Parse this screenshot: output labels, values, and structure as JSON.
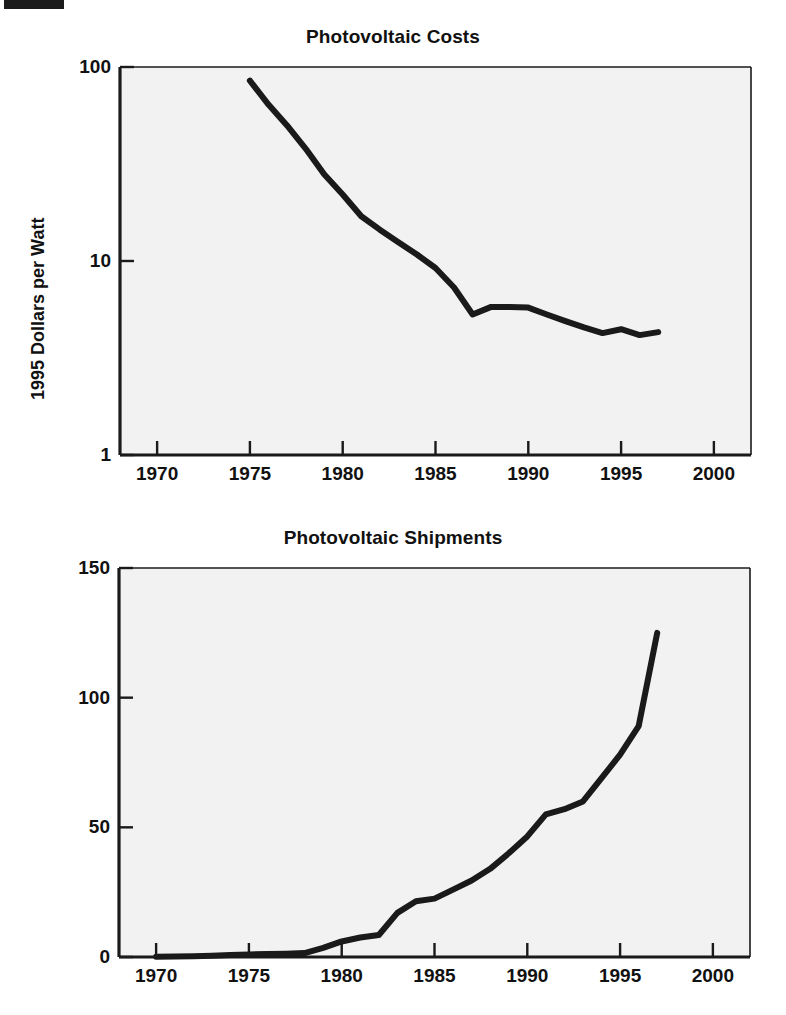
{
  "page": {
    "background_color": "#ffffff",
    "plot_fill_color": "#f2f2f2",
    "line_color": "#1a1a1a",
    "axis_color": "#1a1a1a",
    "text_color": "#111111"
  },
  "chart_data": [
    {
      "id": "photovoltaic-costs",
      "type": "line",
      "title": "Photovoltaic Costs",
      "xlabel": "",
      "ylabel": "1995 Dollars per Watt",
      "xlim": [
        1968,
        2002
      ],
      "ylim": [
        1,
        100
      ],
      "yscale": "log",
      "grid": false,
      "legend": "none",
      "xticks": [
        1970,
        1975,
        1980,
        1985,
        1990,
        1995,
        2000
      ],
      "xticklabels": [
        "1970",
        "1975",
        "1980",
        "1985",
        "1990",
        "1995",
        "2000"
      ],
      "yticks": [
        1,
        10,
        100
      ],
      "yticklabels": [
        "1",
        "10",
        "100"
      ],
      "series": [
        {
          "name": "Cost per watt",
          "x": [
            1975,
            1976,
            1977,
            1978,
            1979,
            1980,
            1981,
            1982,
            1983,
            1984,
            1985,
            1986,
            1987,
            1988,
            1989,
            1990,
            1991,
            1992,
            1993,
            1994,
            1995,
            1996,
            1997
          ],
          "values": [
            85,
            64,
            50,
            38,
            28,
            22,
            17,
            14.5,
            12.5,
            10.8,
            9.2,
            7.3,
            5.3,
            5.8,
            5.8,
            5.75,
            5.3,
            4.9,
            4.55,
            4.25,
            4.45,
            4.15,
            4.3
          ]
        }
      ]
    },
    {
      "id": "photovoltaic-shipments",
      "type": "line",
      "title": "Photovoltaic Shipments",
      "xlabel": "",
      "ylabel": "Annual Megawatts",
      "xlim": [
        1968,
        2002
      ],
      "ylim": [
        0,
        150
      ],
      "yscale": "linear",
      "grid": false,
      "legend": "none",
      "xticks": [
        1970,
        1975,
        1980,
        1985,
        1990,
        1995,
        2000
      ],
      "xticklabels": [
        "1970",
        "1975",
        "1980",
        "1985",
        "1990",
        "1995",
        "2000"
      ],
      "yticks": [
        0,
        50,
        100,
        150
      ],
      "yticklabels": [
        "0",
        "50",
        "100",
        "150"
      ],
      "series": [
        {
          "name": "Annual shipments",
          "x": [
            1970,
            1971,
            1972,
            1973,
            1974,
            1975,
            1976,
            1977,
            1978,
            1979,
            1980,
            1981,
            1982,
            1983,
            1984,
            1985,
            1986,
            1987,
            1988,
            1989,
            1990,
            1991,
            1992,
            1993,
            1994,
            1995,
            1996,
            1997
          ],
          "values": [
            0.1,
            0.2,
            0.3,
            0.5,
            0.8,
            1.0,
            1.2,
            1.3,
            1.5,
            3.5,
            6.0,
            7.5,
            8.5,
            17.0,
            21.5,
            22.5,
            26.0,
            29.5,
            34.0,
            40.0,
            46.5,
            55.0,
            57.0,
            60.0,
            69.0,
            78.0,
            89.0,
            125.0
          ]
        }
      ]
    }
  ]
}
